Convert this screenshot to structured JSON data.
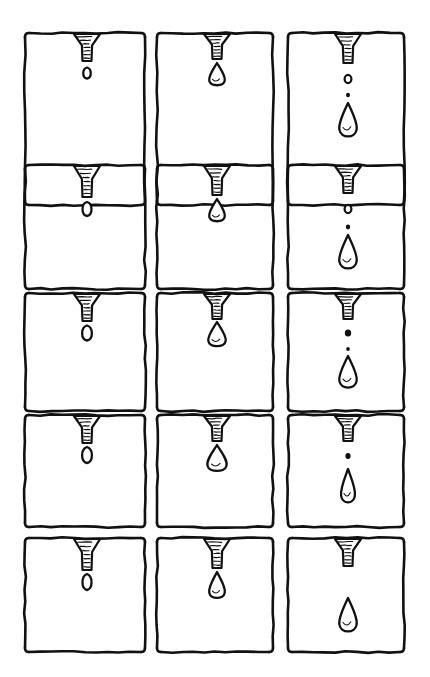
{
  "artwork": {
    "title": "Dripping Faucet Sequence",
    "medium": "pen and ink line drawing",
    "background_color": "#ffffff",
    "ink_color": "#111111",
    "canvas": {
      "width": 430,
      "height": 677
    }
  },
  "grid": {
    "columns": 3,
    "rows": 5,
    "total_panels": 15,
    "column_x": [
      25,
      157,
      288
    ],
    "column_width": [
      120,
      116,
      116
    ],
    "row_y": [
      33,
      165,
      293,
      415,
      538
    ],
    "row_height": [
      172,
      124,
      118,
      112,
      114
    ],
    "panel_gap_x": 12,
    "panel_gap_y": 8
  },
  "nozzle": {
    "name": "funnel-spout",
    "description": "tapered funnel with horizontal hatch shading and a narrow cylindrical tip",
    "hatch_line_count": 7,
    "mouth_width": 26,
    "tip_width": 9
  },
  "panels": [
    {
      "id": "r1c1",
      "row": 1,
      "column": 1,
      "stage": "bead forming",
      "nozzle_tip_y": 28,
      "droplet": {
        "type": "bead",
        "cx": 62,
        "cy": 40,
        "rx": 5,
        "ry": 5.5,
        "attached": true
      },
      "satellites": []
    },
    {
      "id": "r1c2",
      "row": 1,
      "column": 2,
      "stage": "droplet swelling",
      "nozzle_tip_y": 26,
      "droplet": {
        "type": "pendant",
        "cx": 62,
        "cy": 42,
        "rx": 9,
        "ry": 12,
        "attached": true
      },
      "satellites": []
    },
    {
      "id": "r1c3",
      "row": 1,
      "column": 3,
      "stage": "detached and falling",
      "nozzle_tip_y": 30,
      "droplet": {
        "type": "teardrop",
        "cx": 62,
        "cy": 88,
        "rx": 10,
        "ry": 18,
        "attached": false
      },
      "satellites": [
        {
          "cx": 62,
          "cy": 46,
          "r": 3.4,
          "filled": false
        },
        {
          "cx": 62,
          "cy": 62,
          "r": 2.0,
          "filled": true
        }
      ]
    },
    {
      "id": "r2c1",
      "row": 2,
      "column": 1,
      "stage": "bead forming",
      "nozzle_tip_y": 32,
      "droplet": {
        "type": "bead",
        "cx": 62,
        "cy": 44,
        "rx": 6,
        "ry": 7,
        "attached": true
      },
      "satellites": []
    },
    {
      "id": "r2c2",
      "row": 2,
      "column": 2,
      "stage": "droplet swelling",
      "nozzle_tip_y": 30,
      "droplet": {
        "type": "pendant",
        "cx": 62,
        "cy": 46,
        "rx": 9,
        "ry": 12,
        "attached": true
      },
      "satellites": []
    },
    {
      "id": "r2c3",
      "row": 2,
      "column": 3,
      "stage": "detached and falling",
      "nozzle_tip_y": 28,
      "droplet": {
        "type": "teardrop",
        "cx": 62,
        "cy": 88,
        "rx": 10,
        "ry": 18,
        "attached": false
      },
      "satellites": [
        {
          "cx": 62,
          "cy": 44,
          "r": 3.4,
          "filled": false
        },
        {
          "cx": 62,
          "cy": 62,
          "r": 2.2,
          "filled": true
        }
      ]
    },
    {
      "id": "r3c1",
      "row": 3,
      "column": 1,
      "stage": "bead forming",
      "nozzle_tip_y": 28,
      "droplet": {
        "type": "bead",
        "cx": 62,
        "cy": 40,
        "rx": 6.5,
        "ry": 7.5,
        "attached": true
      },
      "satellites": []
    },
    {
      "id": "r3c2",
      "row": 3,
      "column": 2,
      "stage": "droplet swelling",
      "nozzle_tip_y": 26,
      "droplet": {
        "type": "pendant",
        "cx": 62,
        "cy": 42,
        "rx": 10,
        "ry": 13,
        "attached": true
      },
      "satellites": []
    },
    {
      "id": "r3c3",
      "row": 3,
      "column": 3,
      "stage": "detached and falling",
      "nozzle_tip_y": 26,
      "droplet": {
        "type": "teardrop",
        "cx": 62,
        "cy": 80,
        "rx": 10,
        "ry": 17,
        "attached": false
      },
      "satellites": [
        {
          "cx": 62,
          "cy": 40,
          "r": 3.2,
          "filled": true
        },
        {
          "cx": 62,
          "cy": 56,
          "r": 1.8,
          "filled": true
        }
      ]
    },
    {
      "id": "r4c1",
      "row": 4,
      "column": 1,
      "stage": "bead forming",
      "nozzle_tip_y": 28,
      "droplet": {
        "type": "bead",
        "cx": 62,
        "cy": 40,
        "rx": 6.5,
        "ry": 8,
        "attached": true
      },
      "satellites": []
    },
    {
      "id": "r4c2",
      "row": 4,
      "column": 2,
      "stage": "droplet swelling",
      "nozzle_tip_y": 26,
      "droplet": {
        "type": "pendant",
        "cx": 62,
        "cy": 44,
        "rx": 11,
        "ry": 14,
        "attached": true
      },
      "satellites": []
    },
    {
      "id": "r4c3",
      "row": 4,
      "column": 3,
      "stage": "detached and falling",
      "nozzle_tip_y": 26,
      "droplet": {
        "type": "teardrop-elongated",
        "cx": 62,
        "cy": 72,
        "rx": 8,
        "ry": 18,
        "attached": false
      },
      "satellites": [
        {
          "cx": 62,
          "cy": 41,
          "r": 2.6,
          "filled": true
        }
      ]
    },
    {
      "id": "r5c1",
      "row": 5,
      "column": 1,
      "stage": "bead forming",
      "nozzle_tip_y": 32,
      "droplet": {
        "type": "bead",
        "cx": 62,
        "cy": 44,
        "rx": 6,
        "ry": 8,
        "attached": true
      },
      "satellites": []
    },
    {
      "id": "r5c2",
      "row": 5,
      "column": 2,
      "stage": "droplet necking off",
      "nozzle_tip_y": 30,
      "droplet": {
        "type": "teardrop",
        "cx": 62,
        "cy": 48,
        "rx": 9,
        "ry": 14,
        "attached": true
      },
      "satellites": []
    },
    {
      "id": "r5c3",
      "row": 5,
      "column": 3,
      "stage": "free falling drop",
      "nozzle_tip_y": 28,
      "droplet": {
        "type": "teardrop",
        "cx": 62,
        "cy": 78,
        "rx": 10,
        "ry": 18,
        "attached": false
      },
      "satellites": []
    }
  ]
}
